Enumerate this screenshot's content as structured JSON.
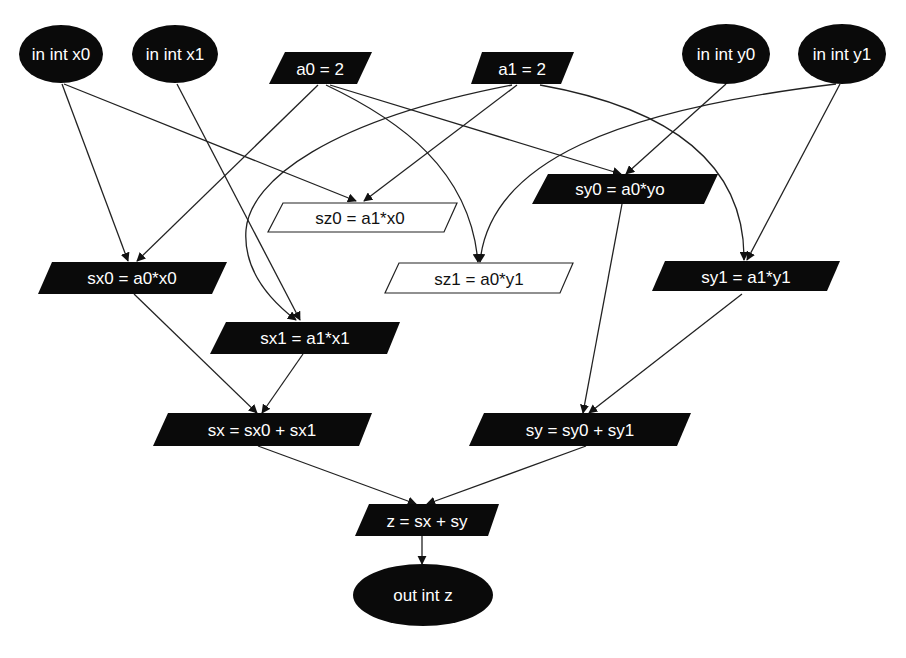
{
  "diagram": {
    "type": "dataflow-graph",
    "nodes": [
      {
        "id": "x0",
        "label": "in int x0",
        "shape": "ellipse",
        "fill": "#0a0a0a",
        "text": "#ffffff"
      },
      {
        "id": "x1",
        "label": "in int x1",
        "shape": "ellipse",
        "fill": "#0a0a0a",
        "text": "#ffffff"
      },
      {
        "id": "a0",
        "label": "a0 = 2",
        "shape": "parallelogram",
        "fill": "#0a0a0a",
        "text": "#ffffff"
      },
      {
        "id": "a1",
        "label": "a1 = 2",
        "shape": "parallelogram",
        "fill": "#0a0a0a",
        "text": "#ffffff"
      },
      {
        "id": "y0",
        "label": "in int y0",
        "shape": "ellipse",
        "fill": "#0a0a0a",
        "text": "#ffffff"
      },
      {
        "id": "y1",
        "label": "in int y1",
        "shape": "ellipse",
        "fill": "#0a0a0a",
        "text": "#ffffff"
      },
      {
        "id": "sy0",
        "label": "sy0 = a0*yo",
        "shape": "parallelogram",
        "fill": "#0a0a0a",
        "text": "#ffffff"
      },
      {
        "id": "sz0",
        "label": "sz0 = a1*x0",
        "shape": "parallelogram",
        "fill": "#ffffff",
        "text": "#111111"
      },
      {
        "id": "sx0",
        "label": "sx0 = a0*x0",
        "shape": "parallelogram",
        "fill": "#0a0a0a",
        "text": "#ffffff"
      },
      {
        "id": "sz1",
        "label": "sz1 = a0*y1",
        "shape": "parallelogram",
        "fill": "#ffffff",
        "text": "#111111"
      },
      {
        "id": "sy1",
        "label": "sy1 = a1*y1",
        "shape": "parallelogram",
        "fill": "#0a0a0a",
        "text": "#ffffff"
      },
      {
        "id": "sx1",
        "label": "sx1 = a1*x1",
        "shape": "parallelogram",
        "fill": "#0a0a0a",
        "text": "#ffffff"
      },
      {
        "id": "sx",
        "label": "sx = sx0 + sx1",
        "shape": "parallelogram",
        "fill": "#0a0a0a",
        "text": "#ffffff"
      },
      {
        "id": "sy",
        "label": "sy = sy0 + sy1",
        "shape": "parallelogram",
        "fill": "#0a0a0a",
        "text": "#ffffff"
      },
      {
        "id": "z",
        "label": "z = sx + sy",
        "shape": "parallelogram",
        "fill": "#0a0a0a",
        "text": "#ffffff"
      },
      {
        "id": "out",
        "label": "out int z",
        "shape": "ellipse",
        "fill": "#0a0a0a",
        "text": "#ffffff"
      }
    ],
    "edges": [
      {
        "from": "x0",
        "to": "sx0"
      },
      {
        "from": "x0",
        "to": "sz0"
      },
      {
        "from": "x1",
        "to": "sx1"
      },
      {
        "from": "a0",
        "to": "sx0"
      },
      {
        "from": "a0",
        "to": "sz1"
      },
      {
        "from": "a0",
        "to": "sy0"
      },
      {
        "from": "a1",
        "to": "sx1"
      },
      {
        "from": "a1",
        "to": "sz0"
      },
      {
        "from": "a1",
        "to": "sy1"
      },
      {
        "from": "y0",
        "to": "sy0"
      },
      {
        "from": "y1",
        "to": "sz1"
      },
      {
        "from": "y1",
        "to": "sy1"
      },
      {
        "from": "sx0",
        "to": "sx"
      },
      {
        "from": "sx1",
        "to": "sx"
      },
      {
        "from": "sy0",
        "to": "sy"
      },
      {
        "from": "sy1",
        "to": "sy"
      },
      {
        "from": "sx",
        "to": "z"
      },
      {
        "from": "sy",
        "to": "z"
      },
      {
        "from": "z",
        "to": "out"
      }
    ]
  }
}
